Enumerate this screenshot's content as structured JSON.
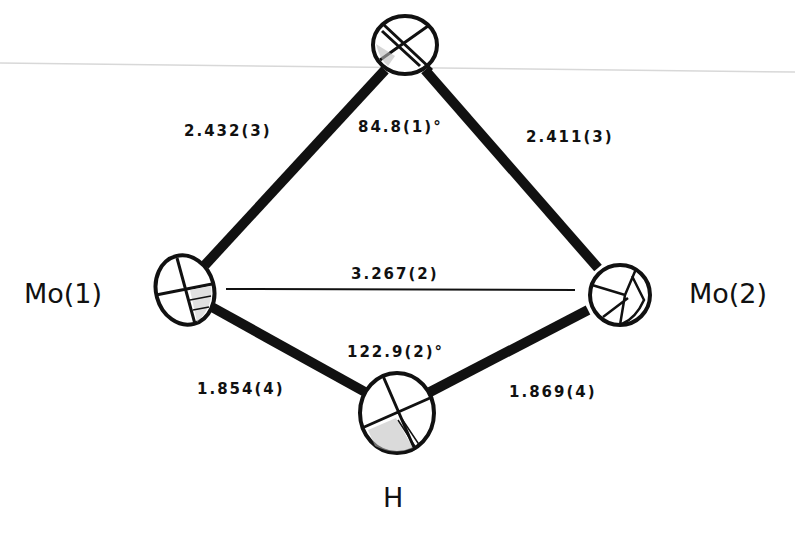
{
  "diagram": {
    "type": "ORTEP molecular structure fragment",
    "atoms": [
      {
        "id": "top",
        "label": "",
        "x": 405,
        "y": 45
      },
      {
        "id": "mo1",
        "label": "Mo(1)",
        "x": 185,
        "y": 290
      },
      {
        "id": "mo2",
        "label": "Mo(2)",
        "x": 620,
        "y": 295
      },
      {
        "id": "h",
        "label": "H",
        "x": 397,
        "y": 415
      }
    ],
    "bonds": [
      {
        "from": "mo1",
        "to": "top",
        "length": "2.432(3)"
      },
      {
        "from": "top",
        "to": "mo2",
        "length": "2.411(3)"
      },
      {
        "from": "mo1",
        "to": "h",
        "length": "1.854(4)"
      },
      {
        "from": "h",
        "to": "mo2",
        "length": "1.869(4)"
      }
    ],
    "distances": [
      {
        "from": "mo1",
        "to": "mo2",
        "value": "3.267(2)"
      }
    ],
    "angles": [
      {
        "at": "top",
        "value": "84.8(1)°"
      },
      {
        "at": "h",
        "value": "122.9(2)°"
      }
    ]
  },
  "labels": {
    "mo1": "Mo(1)",
    "mo2": "Mo(2)",
    "h": "H",
    "bond_mo1_top": "2.432(3)",
    "bond_top_mo2": "2.411(3)",
    "bond_mo1_h": "1.854(4)",
    "bond_h_mo2": "1.869(4)",
    "dist_mo1_mo2": "3.267(2)",
    "angle_top": "84.8(1)°",
    "angle_h": "122.9(2)°"
  },
  "colors": {
    "ink": "#111111",
    "background": "#ffffff",
    "scan_line": "#d8d8d8"
  }
}
